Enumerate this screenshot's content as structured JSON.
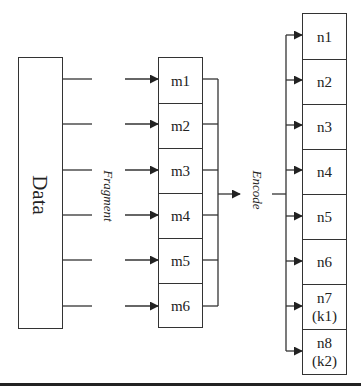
{
  "diagram": {
    "type": "data-fragment-encode-flow",
    "source": {
      "label": "Data"
    },
    "fragment_label": "Fragment",
    "encode_label": "Encode",
    "fragments": [
      "m1",
      "m2",
      "m3",
      "m4",
      "m5",
      "m6"
    ],
    "encoded": [
      "n1",
      "n2",
      "n3",
      "n4",
      "n5",
      "n6",
      "n7\n(k1)",
      "n8\n(k2)"
    ],
    "colors": {
      "stroke": "#333333",
      "background": "#ffffff",
      "rule": "#222222"
    }
  }
}
